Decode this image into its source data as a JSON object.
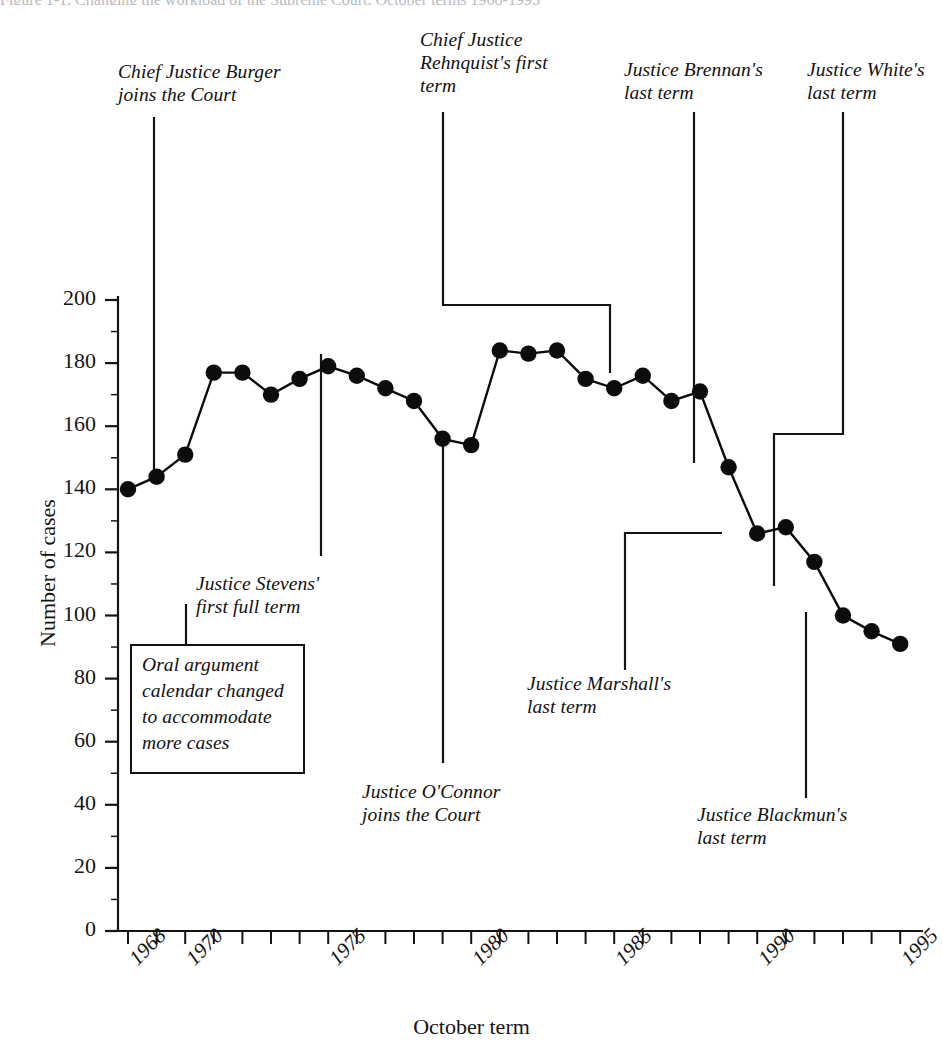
{
  "figure": {
    "top_cut_text": "Figure 1-1. Changing the workload of the Supreme Court, October terms 1968-1995",
    "background": "#ffffff",
    "ink_color": "#141414"
  },
  "axes": {
    "xlabel": "October term",
    "ylabel": "Number of cases",
    "y_ticks": [
      "0",
      "20",
      "40",
      "60",
      "80",
      "100",
      "120",
      "140",
      "160",
      "180",
      "200"
    ],
    "y_tick_values": [
      0,
      20,
      40,
      60,
      80,
      100,
      120,
      140,
      160,
      180,
      200
    ],
    "y_minor_step": 10,
    "x_tick_labels": [
      "1968",
      "1970",
      "1975",
      "1980",
      "1985",
      "1990",
      "1995"
    ],
    "x_tick_label_values": [
      1968,
      1970,
      1975,
      1980,
      1985,
      1990,
      1995
    ],
    "x_minor_step": 1
  },
  "chart_data": {
    "type": "line",
    "title": "",
    "subtitle": "",
    "xlabel": "October term",
    "ylabel": "Number of cases",
    "xlim": [
      1967.6,
      1995.6
    ],
    "ylim": [
      0,
      200
    ],
    "grid": false,
    "legend": "none",
    "marker": "filled-circle",
    "x": [
      1968,
      1969,
      1970,
      1971,
      1972,
      1973,
      1974,
      1975,
      1976,
      1977,
      1978,
      1979,
      1980,
      1981,
      1982,
      1983,
      1984,
      1985,
      1986,
      1987,
      1988,
      1989,
      1990,
      1991,
      1992,
      1993,
      1994,
      1995
    ],
    "values": [
      140,
      144,
      151,
      177,
      177,
      170,
      175,
      179,
      176,
      172,
      168,
      156,
      154,
      184,
      183,
      184,
      175,
      172,
      176,
      168,
      171,
      147,
      126,
      128,
      117,
      100,
      95,
      91
    ],
    "series": [
      {
        "name": "Cases decided",
        "values": [
          140,
          144,
          151,
          177,
          177,
          170,
          175,
          179,
          176,
          172,
          168,
          156,
          154,
          184,
          183,
          184,
          175,
          172,
          176,
          168,
          171,
          147,
          126,
          128,
          117,
          100,
          95,
          91
        ]
      }
    ]
  },
  "annotations": [
    {
      "id": "burger",
      "text": "Chief Justice Burger\njoins the Court",
      "anchor_year": 1969,
      "anchor_value": 144
    },
    {
      "id": "rehnquist",
      "text": "Chief Justice\nRehnquist's first\nterm",
      "anchor_year": 1986,
      "anchor_value": 176
    },
    {
      "id": "brennan",
      "text": "Justice Brennan's\nlast term",
      "anchor_year": 1989,
      "anchor_value": 147
    },
    {
      "id": "white",
      "text": "Justice White's\nlast term",
      "anchor_year": 1992,
      "anchor_value": 117
    },
    {
      "id": "stevens",
      "text": "Justice Stevens'\nfirst full term",
      "anchor_year": 1976,
      "anchor_value": 179
    },
    {
      "id": "oconnor",
      "text": "Justice O'Connor\njoins the Court",
      "anchor_year": 1981,
      "anchor_value": 154
    },
    {
      "id": "marshall",
      "text": "Justice Marshall's\nlast term",
      "anchor_year": 1990,
      "anchor_value": 126
    },
    {
      "id": "blackmun",
      "text": "Justice Blackmun's\nlast term",
      "anchor_year": 1993,
      "anchor_value": 100
    }
  ],
  "callout": {
    "text": "Oral argument\ncalendar changed\nto accommodate\nmore cases",
    "anchor_year": 1970,
    "anchor_value": 151
  }
}
